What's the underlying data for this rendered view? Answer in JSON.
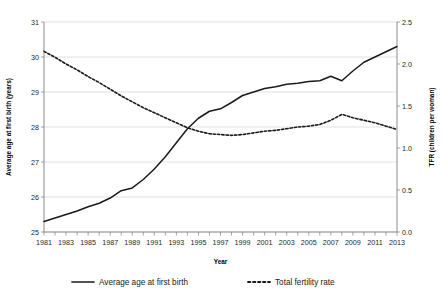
{
  "chart_data": {
    "type": "line",
    "title": "",
    "xlabel": "Year",
    "ylabel": "Average age at first birth (years)",
    "y2label": "TFR (children per woman)",
    "grid": true,
    "legend_position": "bottom",
    "x": [
      1981,
      1982,
      1983,
      1984,
      1985,
      1986,
      1987,
      1988,
      1989,
      1990,
      1991,
      1992,
      1993,
      1994,
      1995,
      1996,
      1997,
      1998,
      1999,
      2000,
      2001,
      2002,
      2003,
      2004,
      2005,
      2006,
      2007,
      2008,
      2009,
      2010,
      2011,
      2012,
      2013
    ],
    "xlim": [
      1981,
      2013
    ],
    "xtick_labels": [
      "1981",
      "1983",
      "1985",
      "1987",
      "1989",
      "1991",
      "1993",
      "1995",
      "1997",
      "1999",
      "2001",
      "2003",
      "2005",
      "2007",
      "2009",
      "2011",
      "2013"
    ],
    "ylim": [
      25,
      31
    ],
    "ytick_labels": [
      "25",
      "26",
      "27",
      "28",
      "29",
      "30",
      "31"
    ],
    "y2lim": [
      0.0,
      2.5
    ],
    "y2tick_labels": [
      "0.0",
      "0.5",
      "1.0",
      "1.5",
      "2.0",
      "2.5"
    ],
    "series": [
      {
        "name": "Average age at first birth",
        "axis": "left",
        "style": "solid",
        "color": "#1a1a1a",
        "values": [
          25.3,
          25.4,
          25.5,
          25.6,
          25.72,
          25.82,
          25.97,
          26.18,
          26.26,
          26.5,
          26.8,
          27.15,
          27.55,
          27.95,
          28.25,
          28.45,
          28.52,
          28.7,
          28.9,
          29.0,
          29.1,
          29.15,
          29.22,
          29.25,
          29.3,
          29.32,
          29.45,
          29.32,
          29.6,
          29.85,
          30.0,
          30.15,
          30.3
        ]
      },
      {
        "name": "Total fertility rate",
        "axis": "right",
        "style": "dotted",
        "color": "#1a1a1a",
        "values": [
          2.15,
          2.08,
          2.0,
          1.93,
          1.85,
          1.78,
          1.7,
          1.62,
          1.55,
          1.48,
          1.42,
          1.36,
          1.3,
          1.24,
          1.2,
          1.17,
          1.16,
          1.15,
          1.16,
          1.18,
          1.2,
          1.21,
          1.23,
          1.25,
          1.26,
          1.28,
          1.33,
          1.4,
          1.36,
          1.33,
          1.3,
          1.26,
          1.22
        ]
      }
    ],
    "legend": [
      {
        "label": "Average age at first birth",
        "style": "solid"
      },
      {
        "label": "Total fertility rate",
        "style": "dotted"
      }
    ]
  }
}
